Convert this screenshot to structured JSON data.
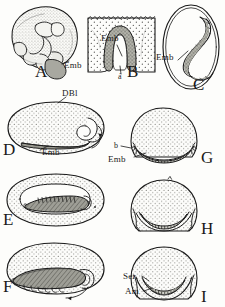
{
  "figure": {
    "type": "scientific-illustration-plate",
    "style": "line-drawing-with-stipple",
    "background_color": "#fdfdfb",
    "ink_color": "#1a1a1a",
    "stipple_color": "#3a3a38",
    "shade_color": "#8d8d86"
  },
  "panels": [
    {
      "letter": "A",
      "letter_pos": {
        "x": 41,
        "y": 74
      },
      "shape": "rounded-mass-lateral-view",
      "labels": [
        {
          "text": "Emb",
          "x": 64,
          "y": 66,
          "leader": true
        }
      ]
    },
    {
      "letter": "B",
      "letter_pos": {
        "x": 133,
        "y": 74
      },
      "shape": "sectioned-block-with-invagination",
      "labels": [
        {
          "text": "Emb",
          "x": 104,
          "y": 38,
          "leader": true
        },
        {
          "text": "á",
          "x": 121,
          "y": 77,
          "leader": true
        }
      ]
    },
    {
      "letter": "C",
      "letter_pos": {
        "x": 199,
        "y": 86
      },
      "shape": "ovoid-egg-with-curved-germ-band",
      "labels": [
        {
          "text": "Emb",
          "x": 160,
          "y": 57,
          "leader": true
        }
      ]
    },
    {
      "letter": "D",
      "letter_pos": {
        "x": 6,
        "y": 152
      },
      "shape": "lateral-oval-egg-stippled",
      "labels": [
        {
          "text": "DBl",
          "x": 66,
          "y": 94,
          "leader": true
        },
        {
          "text": "Emb",
          "x": 46,
          "y": 152,
          "leader": true
        }
      ]
    },
    {
      "letter": "E",
      "letter_pos": {
        "x": 6,
        "y": 222
      },
      "shape": "lateral-oval-egg-with-enclosed-embryo",
      "labels": []
    },
    {
      "letter": "F",
      "letter_pos": {
        "x": 6,
        "y": 289
      },
      "shape": "lateral-oval-egg-with-elongate-embryo",
      "labels": []
    },
    {
      "letter": "G",
      "letter_pos": {
        "x": 206,
        "y": 160
      },
      "shape": "transverse-section-circular",
      "labels": [
        {
          "text": "b",
          "x": 117,
          "y": 147,
          "leader": true
        },
        {
          "text": "Emb",
          "x": 112,
          "y": 160,
          "leader": true
        }
      ]
    },
    {
      "letter": "H",
      "letter_pos": {
        "x": 206,
        "y": 231
      },
      "shape": "transverse-section-circular-deeper",
      "labels": []
    },
    {
      "letter": "I",
      "letter_pos": {
        "x": 206,
        "y": 299
      },
      "shape": "transverse-section-circular-with-membranes",
      "labels": [
        {
          "text": "Ser",
          "x": 126,
          "y": 277,
          "leader": true
        },
        {
          "text": "Am",
          "x": 129,
          "y": 292,
          "leader": true
        }
      ]
    }
  ],
  "abbreviations": {
    "Emb": "embryo",
    "DBl": "dorsal blastoderm",
    "Ser": "serosa",
    "Am": "amnion",
    "a": "point a",
    "b": "point b"
  }
}
